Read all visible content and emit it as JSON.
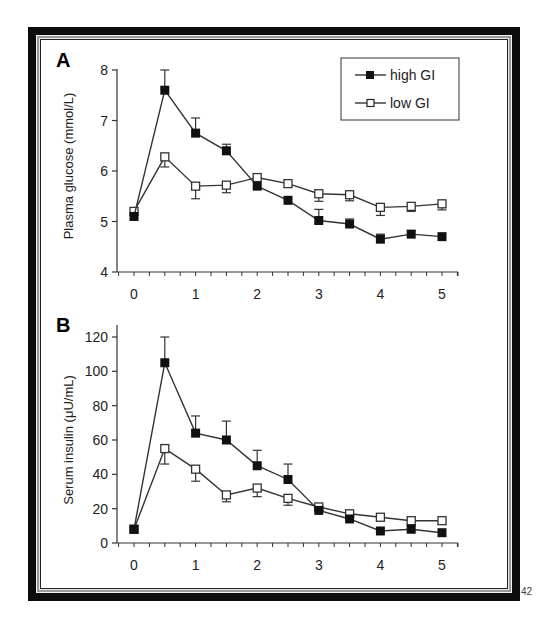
{
  "page_number": "42",
  "legend": {
    "items": [
      {
        "label": "high GI",
        "marker": "filled-square",
        "color": "#111111"
      },
      {
        "label": "low GI",
        "marker": "open-square",
        "color": "#333333"
      }
    ]
  },
  "chart_data": [
    {
      "type": "line",
      "panel_label": "A",
      "title": "",
      "xlabel": "",
      "ylabel": "Plasma glucose (mmol/L)",
      "xlim": [
        -0.3,
        5.25
      ],
      "ylim": [
        4,
        8
      ],
      "x_ticks": [
        0,
        1,
        2,
        3,
        4,
        5
      ],
      "x_minor_step": 0.25,
      "y_ticks": [
        4,
        5,
        6,
        7,
        8
      ],
      "grid": false,
      "legend_position": "top-right",
      "x": [
        0,
        0.5,
        1,
        1.5,
        2,
        2.5,
        3,
        3.5,
        4,
        4.5,
        5
      ],
      "series": [
        {
          "name": "high GI",
          "marker": "filled-square",
          "values": [
            5.1,
            7.6,
            6.75,
            6.4,
            5.7,
            5.42,
            5.02,
            4.95,
            4.65,
            4.75,
            4.7
          ],
          "error_up": [
            0.05,
            0.4,
            0.3,
            0.13,
            0.05,
            0.04,
            0.22,
            0.1,
            0.1,
            0.07,
            0.05
          ],
          "error_dir": "up"
        },
        {
          "name": "low GI",
          "marker": "open-square",
          "values": [
            5.2,
            6.28,
            5.7,
            5.72,
            5.87,
            5.75,
            5.55,
            5.53,
            5.28,
            5.3,
            5.35
          ],
          "error_down": [
            0.05,
            0.2,
            0.25,
            0.15,
            0.05,
            0.05,
            0.15,
            0.12,
            0.16,
            0.1,
            0.12
          ],
          "error_dir": "down"
        }
      ]
    },
    {
      "type": "line",
      "panel_label": "B",
      "title": "",
      "xlabel": "",
      "ylabel": "Serum insulin (μU/mL)",
      "xlim": [
        -0.3,
        5.25
      ],
      "ylim": [
        0,
        120
      ],
      "x_ticks": [
        0,
        1,
        2,
        3,
        4,
        5
      ],
      "x_minor_step": 0.25,
      "y_ticks": [
        0,
        20,
        40,
        60,
        80,
        100,
        120
      ],
      "grid": false,
      "x": [
        0,
        0.5,
        1,
        1.5,
        2,
        2.5,
        3,
        3.5,
        4,
        4.5,
        5
      ],
      "series": [
        {
          "name": "high GI",
          "marker": "filled-square",
          "values": [
            8,
            105,
            64,
            60,
            45,
            37,
            19,
            14,
            7,
            8,
            6
          ],
          "error_up": [
            1,
            15,
            10,
            11,
            9,
            9,
            2,
            2,
            1,
            2,
            1
          ],
          "error_dir": "up"
        },
        {
          "name": "low GI",
          "marker": "open-square",
          "values": [
            8,
            55,
            43,
            28,
            32,
            26,
            21,
            17,
            15,
            13,
            13
          ],
          "error_down": [
            1,
            9,
            7,
            4,
            5,
            4,
            2,
            2,
            2,
            2,
            2
          ],
          "error_dir": "down"
        }
      ]
    }
  ]
}
